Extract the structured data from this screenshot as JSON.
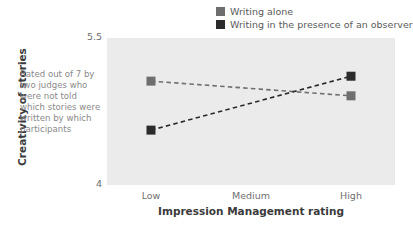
{
  "chart_data": {
    "type": "line",
    "title": "",
    "xlabel": "Impression Management rating",
    "ylabel": "Creativity of stories",
    "categories": [
      "Low",
      "Medium",
      "High"
    ],
    "ylim": [
      4,
      5.5
    ],
    "yticks": [
      "4",
      "5.5"
    ],
    "grid": false,
    "legend_position": "top-right",
    "linestyle": "dashed",
    "marker": "square",
    "annotation": "Rated out of 7 by two judges who were not told which stories were written by which participants",
    "series": [
      {
        "name": "Writing alone",
        "color": "#6e6e6e",
        "x": [
          "Low",
          "High"
        ],
        "values": [
          5.06,
          4.91
        ]
      },
      {
        "name": "Writing in the presence of an observer",
        "color": "#2b2b2b",
        "x": [
          "Low",
          "High"
        ],
        "values": [
          4.56,
          5.11
        ]
      }
    ]
  },
  "axes": {
    "y_title": "Creativity of stories",
    "x_title": "Impression Management rating",
    "y_tick_top": "5.5",
    "y_tick_bottom": "4",
    "x_tick_low": "Low",
    "x_tick_medium": "Medium",
    "x_tick_high": "High"
  },
  "legend": {
    "items": [
      {
        "label": "Writing alone",
        "color": "#6e6e6e"
      },
      {
        "label": "Writing in the presence of an observer",
        "color": "#2b2b2b"
      }
    ]
  },
  "annotation": {
    "lines": [
      "Rated out of 7 by",
      "two judges who",
      "were not told",
      "which stories were",
      "written by which",
      "participants"
    ]
  },
  "colors": {
    "panel": "#ebebeb",
    "series_alone": "#6e6e6e",
    "series_observer": "#2b2b2b",
    "tick_text": "#6f6f6f",
    "title_text": "#3b3b3b",
    "annotation_text": "#8a8a8a"
  }
}
